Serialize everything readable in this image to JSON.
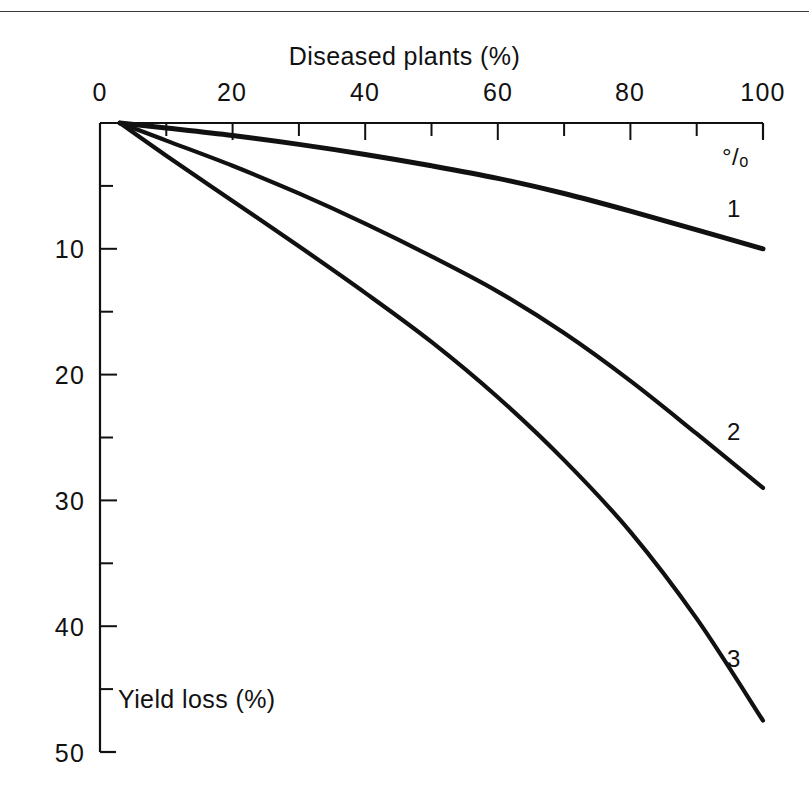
{
  "figure": {
    "background_color": "#ffffff",
    "ink_color": "#111111",
    "rule_color": "#3a3a3a"
  },
  "titles": {
    "x_axis_title": "Diseased plants (%)",
    "y_axis_title": "Yield loss (%)",
    "percent_symbol": "°/ₒ"
  },
  "axes": {
    "x": {
      "position": "top",
      "tick_labels": [
        "0",
        "20",
        "40",
        "60",
        "80",
        "100"
      ],
      "tick_values": [
        0,
        20,
        40,
        60,
        80,
        100
      ],
      "minor_tick_values": [
        10,
        30,
        50,
        70,
        90
      ],
      "range": [
        0,
        100
      ]
    },
    "y": {
      "position": "left",
      "direction": "inverted",
      "tick_labels": [
        "10",
        "20",
        "30",
        "40",
        "50"
      ],
      "tick_values": [
        10,
        20,
        30,
        40,
        50
      ],
      "minor_tick_values": [
        5,
        15,
        25,
        35,
        45
      ],
      "range": [
        0,
        50
      ]
    }
  },
  "curve_labels": [
    {
      "id": "1",
      "text": "1"
    },
    {
      "id": "2",
      "text": "2"
    },
    {
      "id": "3",
      "text": "3"
    }
  ],
  "chart_data": {
    "type": "line",
    "title": "Diseased plants (%)",
    "xlabel": "Diseased plants (%)",
    "ylabel": "Yield loss (%)",
    "xlim": [
      0,
      100
    ],
    "ylim": [
      0,
      50
    ],
    "y_axis_inverted": true,
    "grid": false,
    "legend": "inline-right-end-labels",
    "x": [
      3,
      10,
      20,
      30,
      40,
      50,
      60,
      70,
      80,
      90,
      100
    ],
    "series": [
      {
        "name": "1",
        "label": "1",
        "values": [
          0.0,
          0.4,
          1.0,
          1.7,
          2.5,
          3.4,
          4.4,
          5.6,
          7.0,
          8.5,
          10.0
        ]
      },
      {
        "name": "2",
        "label": "2",
        "values": [
          0.0,
          1.4,
          3.4,
          5.6,
          8.0,
          10.6,
          13.4,
          16.7,
          20.5,
          24.7,
          29.0
        ]
      },
      {
        "name": "3",
        "label": "3",
        "values": [
          0.0,
          2.6,
          6.2,
          9.8,
          13.5,
          17.4,
          21.8,
          26.8,
          32.5,
          39.4,
          47.5
        ]
      }
    ]
  }
}
